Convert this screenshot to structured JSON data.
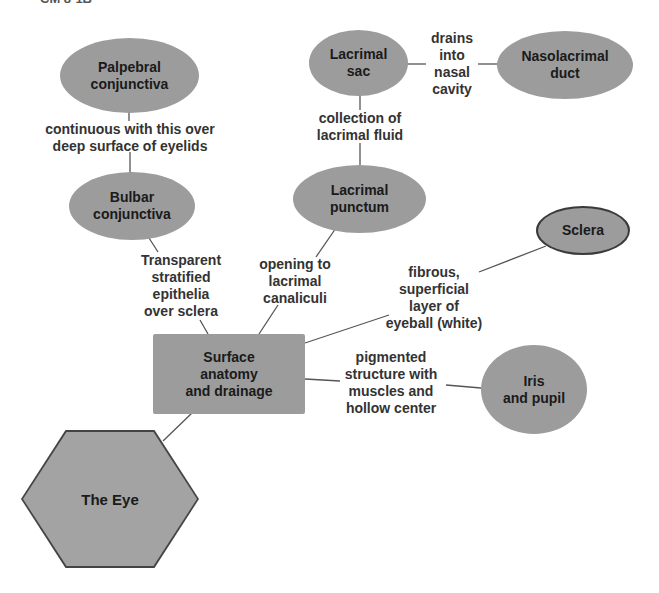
{
  "caption": "CM 8-1B",
  "diagram": {
    "center": {
      "label": "Surface\nanatomy\nand drainage"
    },
    "root": {
      "label": "The Eye"
    },
    "nodes": {
      "palpebral": "Palpebral\nconjunctiva",
      "bulbar": "Bulbar\nconjunctiva",
      "lacrimal_sac": "Lacrimal\nsac",
      "nasolacrimal": "Nasolacrimal\nduct",
      "punctum": "Lacrimal\npunctum",
      "sclera": "Sclera",
      "iris": "Iris\nand pupil"
    },
    "links": {
      "palpebral_bulbar": "continuous with this over\ndeep surface of eyelids",
      "bulbar_center": "Transparent\nstratified\nepithelia\nover sclera",
      "sac_duct": "drains\ninto\nnasal\ncavity",
      "sac_punctum": "collection of\nlacrimal fluid",
      "punctum_center": "opening to\nlacrimal\ncanaliculi",
      "sclera_center": "fibrous,\nsuperficial\nlayer of\neyeball (white)",
      "iris_center": "pigmented\nstructure with\nmuscles and\nhollow center"
    }
  },
  "colors": {
    "node_fill": "#9c9c9c",
    "hex_fill": "#a3a3a3",
    "line": "#555555",
    "text": "#1a1a1a"
  }
}
